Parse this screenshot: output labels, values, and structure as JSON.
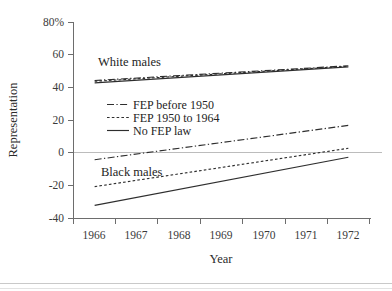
{
  "chart_data": {
    "type": "line",
    "title": "",
    "subtitle": "",
    "xlabel": "Year",
    "ylabel": "Representation",
    "x": [
      1966,
      1967,
      1968,
      1969,
      1970,
      1971,
      1972
    ],
    "xtick_labels": [
      "1966",
      "1967",
      "1968",
      "1969",
      "1970",
      "1971",
      "1972"
    ],
    "ytick_labels": [
      "80%",
      "60",
      "40",
      "20",
      "0",
      "-20",
      "-40"
    ],
    "ytick_values": [
      80,
      60,
      40,
      20,
      0,
      -20,
      -40
    ],
    "xlim": [
      1965.5,
      1972.5
    ],
    "ylim": [
      -40,
      80
    ],
    "grid": "zero-line-only",
    "legend_position": "center-left-inside",
    "group_annotations": [
      {
        "text": "White males",
        "x": 1967.1,
        "y": 57
      },
      {
        "text": "Black males",
        "x": 1967.2,
        "y": -7
      }
    ],
    "legend": [
      {
        "label": "FEP before 1950",
        "style": "dash-dot"
      },
      {
        "label": "FEP 1950 to 1964",
        "style": "dotted"
      },
      {
        "label": "No FEP law",
        "style": "solid"
      }
    ],
    "series": [
      {
        "name": "White males, FEP before 1950",
        "group": "White males",
        "style": "dash-dot",
        "x": [
          1966,
          1972
        ],
        "values": [
          44.5,
          53.5
        ]
      },
      {
        "name": "White males, FEP 1950 to 1964",
        "group": "White males",
        "style": "dotted",
        "x": [
          1966,
          1972
        ],
        "values": [
          44.0,
          53.2
        ]
      },
      {
        "name": "White males, No FEP law",
        "group": "White males",
        "style": "solid",
        "x": [
          1966,
          1972
        ],
        "values": [
          43.0,
          52.8
        ]
      },
      {
        "name": "Black males, FEP before 1950",
        "group": "Black males",
        "style": "dash-dot",
        "x": [
          1966,
          1972
        ],
        "values": [
          -4.0,
          17.0
        ]
      },
      {
        "name": "Black males, FEP 1950 to 1964",
        "group": "Black males",
        "style": "dotted",
        "x": [
          1966,
          1972
        ],
        "values": [
          -20.5,
          3.0
        ]
      },
      {
        "name": "Black males, No FEP law",
        "group": "Black males",
        "style": "solid",
        "x": [
          1966,
          1972
        ],
        "values": [
          -32.0,
          -2.5
        ]
      }
    ]
  }
}
